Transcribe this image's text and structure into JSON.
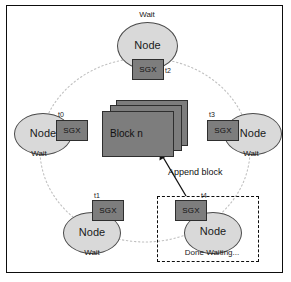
{
  "diagram": {
    "frame": {
      "border_color": "#0d0d0d",
      "background": "#ffffff"
    },
    "palette": {
      "node_fill": "#d9d9d9",
      "node_stroke": "#4a4a4a",
      "sgx_fill": "#7d7d7d",
      "sgx_stroke": "#2e2e2e",
      "block_fill": "#7d7d7d",
      "block_stroke": "#2e2e2e",
      "ring_stroke": "#b8b8b8",
      "dashed_stroke": "#0d0d0d",
      "arrow_stroke": "#111111",
      "text": "#111111"
    },
    "nodes": [
      {
        "id": "node-top",
        "label": "Node",
        "sgx_label": "SGX",
        "time_label": "t2",
        "status": "Wait",
        "status_position": "above"
      },
      {
        "id": "node-left",
        "label": "Node",
        "sgx_label": "SGX",
        "time_label": "t0",
        "status": "Wait",
        "status_position": "below"
      },
      {
        "id": "node-right",
        "label": "Node",
        "sgx_label": "SGX",
        "time_label": "t3",
        "status": "Wait",
        "status_position": "below"
      },
      {
        "id": "node-bottom-left",
        "label": "Node",
        "sgx_label": "SGX",
        "time_label": "t1",
        "status": "Wait",
        "status_position": "below"
      },
      {
        "id": "node-bottom-right",
        "label": "Node",
        "sgx_label": "SGX",
        "time_label": "t4",
        "status": "Done Waiting...",
        "status_position": "below"
      }
    ],
    "block_stack": {
      "label": "Block n",
      "card_count": 3
    },
    "annotations": {
      "append_block": "Append block"
    }
  }
}
